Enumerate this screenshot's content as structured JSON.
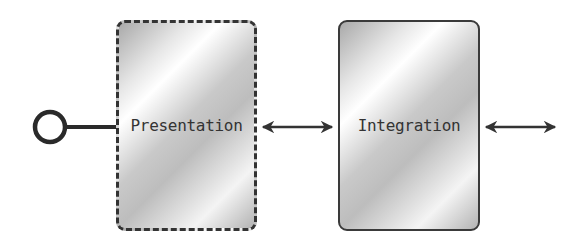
{
  "diagram": {
    "nodes": [
      {
        "id": "presentation",
        "label": "Presentation",
        "border": "dashed"
      },
      {
        "id": "integration",
        "label": "Integration",
        "border": "solid"
      }
    ],
    "edges": [
      {
        "from": "interface-lollipop",
        "to": "presentation",
        "type": "line"
      },
      {
        "from": "presentation",
        "to": "integration",
        "type": "bidirectional-arrow"
      },
      {
        "from": "integration",
        "to": "external",
        "type": "bidirectional-arrow"
      }
    ],
    "colors": {
      "stroke": "#333333",
      "fill_light": "#ffffff",
      "fill_dark": "#a9a9a9"
    }
  }
}
